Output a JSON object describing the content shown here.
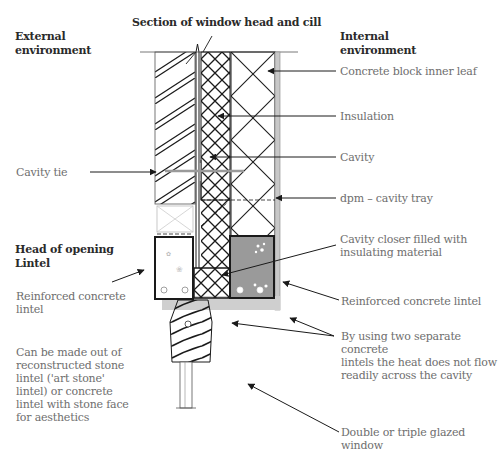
{
  "title": "Section of window head and cill",
  "headings": {
    "external": [
      "External",
      "environment"
    ],
    "internal": [
      "Internal",
      "environment"
    ],
    "head_of_opening": [
      "Head of opening",
      "Lintel"
    ]
  },
  "labels": {
    "concrete_block": "Concrete block inner leaf",
    "insulation": "Insulation",
    "cavity": "Cavity",
    "dpm": "dpm – cavity tray",
    "cavity_closer": [
      "Cavity closer filled with",
      "insulating material"
    ],
    "cavity_tie": "Cavity tie",
    "rc_lintel_left": [
      "Reinforced concrete",
      "lintel"
    ],
    "rc_lintel_right": "Reinforced concrete lintel",
    "two_lintels": [
      "By using two separate concrete",
      "lintels the heat does not flow",
      "readily across the cavity"
    ],
    "art_stone": [
      "Can be made out of",
      "reconstructed stone",
      "lintel ('art stone'",
      "lintel) or concrete",
      "lintel with stone face",
      "for aesthetics"
    ],
    "glazed_window": "Double or triple glazed window"
  },
  "colors": {
    "line": "#1a1a1a",
    "label_text": "#6e6e6e",
    "heading_text": "#2a2a2a",
    "inner_lintel_fill": "#9a9a9a",
    "plaster_strip": "#c8c8c8",
    "cavity_tie": "#9a9a9a"
  }
}
